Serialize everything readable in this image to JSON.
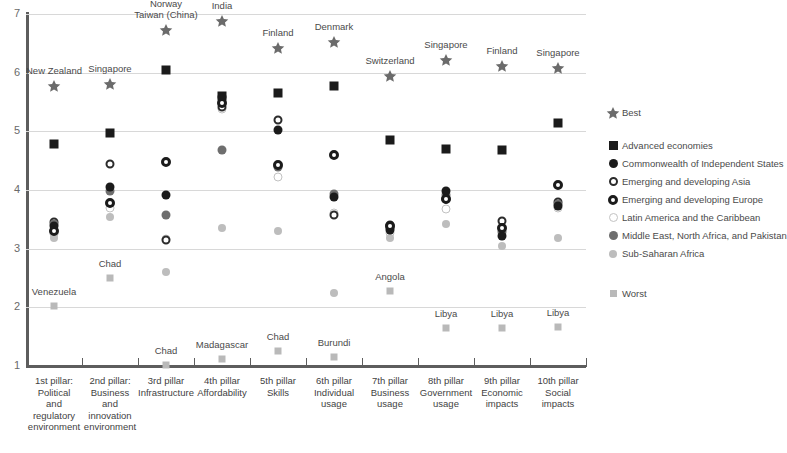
{
  "chart_data": {
    "type": "scatter",
    "title": "",
    "xlabel": "",
    "ylabel": "",
    "ylim": [
      1,
      7
    ],
    "yticks": [
      "1",
      "2",
      "3",
      "4",
      "5",
      "6",
      "7"
    ],
    "grid": true,
    "legend_position": "right",
    "categories": [
      "1st pillar: Political and regulatory environment",
      "2nd pillar: Business and innovation environment",
      "3rd pillar: Infrastructure",
      "4th pillar: Affordability",
      "5th pillar: Skills",
      "6th pillar: Individual usage",
      "7th pillar: Business usage",
      "8th pillar: Government usage",
      "9th pillar: Economic impacts",
      "10th pillar: Social impacts"
    ],
    "category_lines": [
      [
        "1st pillar:",
        "Political",
        "and",
        "regulatory",
        "environment"
      ],
      [
        "2nd pillar:",
        "Business",
        "and",
        "innovation",
        "environment"
      ],
      [
        "3rd pillar",
        "Infrastructure"
      ],
      [
        "4th pillar",
        "Affordability"
      ],
      [
        "5th pillar",
        "Skills"
      ],
      [
        "6th pillar",
        "Individual",
        "usage"
      ],
      [
        "7th pillar",
        "Business",
        "usage"
      ],
      [
        "8th pillar",
        "Government",
        "usage"
      ],
      [
        "9th pillar",
        "Economic",
        "impacts"
      ],
      [
        "10th pillar",
        "Social",
        "impacts"
      ]
    ],
    "series": [
      {
        "name": "Best",
        "key": "best",
        "values": [
          5.78,
          5.8,
          6.72,
          6.88,
          6.42,
          6.52,
          5.95,
          6.22,
          6.12,
          6.08
        ]
      },
      {
        "name": "Advanced economies",
        "key": "adv",
        "values": [
          4.78,
          4.97,
          6.05,
          5.6,
          5.65,
          5.78,
          4.85,
          4.7,
          4.68,
          5.15
        ]
      },
      {
        "name": "Commonwealth of Independent States",
        "key": "cis",
        "values": [
          3.38,
          4.05,
          3.92,
          5.58,
          5.03,
          3.88,
          3.32,
          3.98,
          3.22,
          3.73
        ]
      },
      {
        "name": "Emerging and developing Asia",
        "key": "asia",
        "values": [
          3.46,
          4.45,
          3.14,
          5.42,
          5.2,
          3.58,
          3.4,
          3.85,
          3.48,
          3.79
        ]
      },
      {
        "name": "Emerging and developing Europe",
        "key": "europe",
        "values": [
          3.3,
          3.78,
          4.48,
          5.48,
          4.42,
          4.6,
          3.38,
          3.84,
          3.36,
          4.08
        ]
      },
      {
        "name": "Latin America and the Caribbean",
        "key": "latam",
        "values": [
          3.25,
          3.7,
          3.16,
          5.38,
          4.22,
          3.6,
          3.26,
          3.68,
          3.3,
          3.7
        ]
      },
      {
        "name": "Middle East, North Africa, and Pakistan",
        "key": "mena",
        "values": [
          3.42,
          3.98,
          3.58,
          4.68,
          4.4,
          3.94,
          3.36,
          3.92,
          3.28,
          3.76
        ]
      },
      {
        "name": "Sub-Saharan Africa",
        "key": "ssa",
        "values": [
          3.18,
          3.54,
          2.6,
          3.35,
          3.3,
          2.25,
          3.18,
          3.42,
          3.05,
          3.18
        ]
      },
      {
        "name": "Worst",
        "key": "worst",
        "values": [
          2.02,
          2.5,
          1.02,
          1.12,
          1.26,
          1.15,
          2.28,
          1.65,
          1.64,
          1.66
        ]
      }
    ],
    "best_labels": [
      "New Zealand",
      "Singapore",
      "Norway\nTaiwan (China)",
      "India",
      "Finland",
      "Denmark",
      "Switzerland",
      "Singapore",
      "Finland",
      "Singapore"
    ],
    "worst_labels": [
      "Venezuela",
      "Chad",
      "Chad",
      "Madagascar",
      "Chad",
      "Burundi",
      "Angola",
      "Libya",
      "Libya",
      "Libya"
    ]
  },
  "legend": {
    "best_label": "Best",
    "worst_label": "Worst",
    "entries": [
      {
        "label": "Advanced economies",
        "symbol": "square-marker"
      },
      {
        "label": "Commonwealth of Independent States",
        "symbol": "filled-circle-marker"
      },
      {
        "label": "Emerging and developing Asia",
        "symbol": "open-circle-marker"
      },
      {
        "label": "Emerging and developing Europe",
        "symbol": "bold-open-circle-marker"
      },
      {
        "label": "Latin America and the Caribbean",
        "symbol": "light-open-circle-marker"
      },
      {
        "label": "Middle East, North Africa, and Pakistan",
        "symbol": "gray-circle-marker"
      },
      {
        "label": "Sub-Saharan Africa",
        "symbol": "light-gray-circle-marker"
      }
    ]
  },
  "colors": {
    "best_star": "#6b6b6b",
    "worst_square": "#b9b9b9",
    "advanced": "#1b1b1b",
    "axis": "#5d5d5d",
    "grid": "#d8d8d8",
    "text": "#4a4a4a"
  }
}
